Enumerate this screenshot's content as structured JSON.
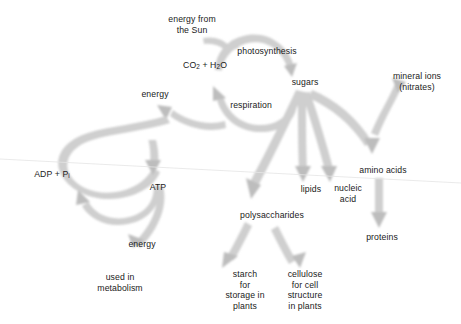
{
  "diagram": {
    "background_color": "#ffffff",
    "arrow_color": "#cfcfcf",
    "arrow_head_color": "#bdbdbd",
    "text_color": "#1a1a1a",
    "width": 461,
    "height": 324
  },
  "nodes": {
    "energy_from_sun": "energy from\nthe Sun",
    "photosynthesis": "photosynthesis",
    "co2_h2o_pre": "CO",
    "co2_h2o_sub1": "2",
    "co2_h2o_mid": " + H",
    "co2_h2o_sub2": "2",
    "co2_h2o_post": "O",
    "sugars": "sugars",
    "mineral_ions": "mineral ions\n(nitrates)",
    "respiration": "respiration",
    "energy_left": "energy",
    "adp_pre": "ADP + P",
    "adp_sub": "i",
    "atp": "ATP",
    "energy_lower": "energy",
    "used_in_metabolism": "used in\nmetabolism",
    "lipids": "lipids",
    "nucleic_acid": "nucleic\nacid",
    "amino_acids": "amino acids",
    "polysaccharides": "polysaccharides",
    "proteins": "proteins",
    "starch": "starch\nfor\nstorage in\nplants",
    "cellulose": "cellulose\nfor cell\nstructure\nin plants"
  },
  "edges": [
    {
      "from": "energy from the Sun",
      "to": "photosynthesis"
    },
    {
      "from": "CO2 + H2O",
      "to": "sugars",
      "via": "photosynthesis"
    },
    {
      "from": "sugars",
      "to": "CO2 + H2O",
      "via": "respiration"
    },
    {
      "from": "respiration",
      "to": "energy"
    },
    {
      "from": "energy",
      "to": "ATP",
      "via": "ADP + Pi"
    },
    {
      "from": "ATP",
      "to": "ADP + Pi"
    },
    {
      "from": "ATP",
      "to": "used in metabolism",
      "via": "energy"
    },
    {
      "from": "sugars",
      "to": "polysaccharides"
    },
    {
      "from": "sugars",
      "to": "lipids"
    },
    {
      "from": "sugars",
      "to": "nucleic acid"
    },
    {
      "from": "sugars",
      "to": "amino acids"
    },
    {
      "from": "mineral ions (nitrates)",
      "to": "amino acids"
    },
    {
      "from": "amino acids",
      "to": "proteins"
    },
    {
      "from": "polysaccharides",
      "to": "starch for storage in plants"
    },
    {
      "from": "polysaccharides",
      "to": "cellulose for cell structure in plants"
    }
  ]
}
